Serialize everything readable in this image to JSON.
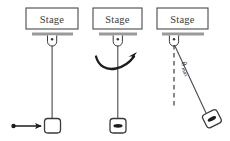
{
  "figure": {
    "type": "physics-diagram",
    "background_color": "#ffffff",
    "line_color": "#2b2b2b",
    "support_bar_color": "#9a9a9a",
    "stage_border_color": "#4a4a4a"
  },
  "panels": [
    {
      "id": "panel-left",
      "stage_label": "Stage",
      "annotation": "",
      "bob_style": "rounded-square-empty",
      "has_push_arrow": true,
      "has_swing_arrow": false,
      "has_angle_label": false
    },
    {
      "id": "panel-middle",
      "stage_label": "Stage",
      "annotation": "",
      "bob_style": "rounded-square-oval",
      "has_push_arrow": false,
      "has_swing_arrow": true,
      "has_angle_label": false
    },
    {
      "id": "panel-right",
      "stage_label": "Stage",
      "annotation": "",
      "bob_style": "rounded-square-oval-tilted",
      "has_push_arrow": false,
      "has_swing_arrow": false,
      "has_angle_label": true
    }
  ],
  "labels": {
    "stage_left": "Stage",
    "stage_middle": "Stage",
    "stage_right": "Stage",
    "theta_symbol": "θ",
    "theta_subscript": "max"
  }
}
